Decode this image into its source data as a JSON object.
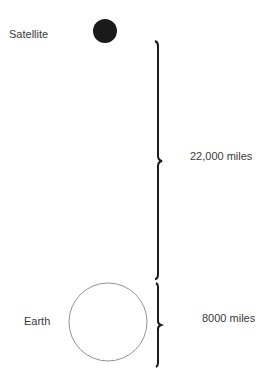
{
  "diagram": {
    "satellite": {
      "label": "Satellite"
    },
    "earth": {
      "label": "Earth"
    },
    "distance": {
      "label": "22,000 miles"
    },
    "diameter": {
      "label": "8000 miles"
    }
  }
}
